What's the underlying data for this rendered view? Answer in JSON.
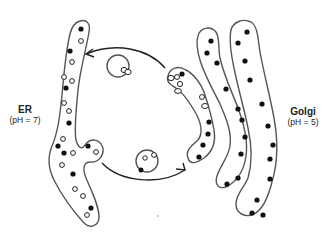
{
  "diagram": {
    "type": "cell-organelle-transport",
    "labels": {
      "er": {
        "name": "ER",
        "ph": "(pH = 7)"
      },
      "golgi": {
        "name": "Golgi",
        "ph": "(pH = 5)"
      }
    },
    "arrows": [
      {
        "id": "forward",
        "from": "ER",
        "to": "Golgi",
        "direction": "ER bud -> first Golgi cisterna (bottom arc)"
      },
      {
        "id": "retrograde",
        "from": "Golgi",
        "to": "ER",
        "direction": "first Golgi cisterna -> ER (top arc)"
      }
    ],
    "legend_implied": {
      "filled_dot": "cargo protein",
      "hollow_dot": "receptor / retained protein"
    },
    "colors": {
      "membrane": "#555555",
      "arrow": "#222222",
      "filled_dot": "#111111",
      "hollow_dot_fill": "#ffffff"
    }
  }
}
